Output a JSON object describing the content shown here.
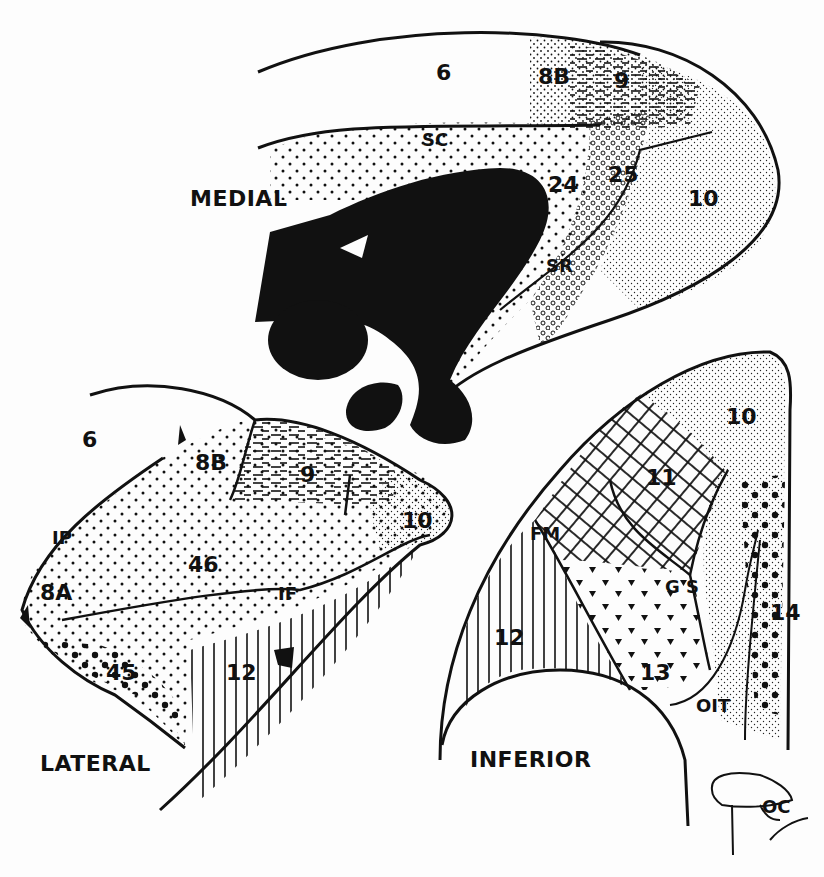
{
  "figure": {
    "type": "cytoarchitectonic map",
    "colors": {
      "ink": "#111111",
      "paper": "#fdfdfd"
    }
  },
  "views": {
    "medial": {
      "label": "MEDIAL",
      "areas": [
        {
          "id": "6",
          "label": "6",
          "pattern": "blank"
        },
        {
          "id": "8B",
          "label": "8B",
          "pattern": "fine-dots"
        },
        {
          "id": "9",
          "label": "9",
          "pattern": "dashes"
        },
        {
          "id": "24",
          "label": "24",
          "pattern": "medium-dots"
        },
        {
          "id": "25",
          "label": "25",
          "pattern": "open-circles"
        },
        {
          "id": "10",
          "label": "10",
          "pattern": "fine-stipple"
        }
      ],
      "sulci": [
        {
          "id": "SC",
          "label": "SC"
        },
        {
          "id": "SR",
          "label": "SR"
        }
      ],
      "structures": [
        {
          "id": "corpus-callosum",
          "fill": "solid-black"
        }
      ]
    },
    "lateral": {
      "label": "LATERAL",
      "areas": [
        {
          "id": "6",
          "label": "6",
          "pattern": "blank"
        },
        {
          "id": "8B",
          "label": "8B",
          "pattern": "fine-dots"
        },
        {
          "id": "9",
          "label": "9",
          "pattern": "dashes"
        },
        {
          "id": "10",
          "label": "10",
          "pattern": "fine-stipple"
        },
        {
          "id": "8A",
          "label": "8A",
          "pattern": "fine-dots"
        },
        {
          "id": "46",
          "label": "46",
          "pattern": "medium-dots"
        },
        {
          "id": "45",
          "label": "45",
          "pattern": "large-dots"
        },
        {
          "id": "12",
          "label": "12",
          "pattern": "vertical-lines"
        }
      ],
      "sulci": [
        {
          "id": "IP",
          "label": "IP"
        },
        {
          "id": "IF",
          "label": "IF"
        }
      ]
    },
    "inferior": {
      "label": "INFERIOR",
      "areas": [
        {
          "id": "10",
          "label": "10",
          "pattern": "fine-stipple"
        },
        {
          "id": "11",
          "label": "11",
          "pattern": "crosshatch"
        },
        {
          "id": "12",
          "label": "12",
          "pattern": "vertical-lines"
        },
        {
          "id": "13",
          "label": "13",
          "pattern": "triangles"
        },
        {
          "id": "14",
          "label": "14",
          "pattern": "large-dots"
        }
      ],
      "sulci": [
        {
          "id": "FM",
          "label": "FM"
        },
        {
          "id": "GS",
          "label": "G S"
        },
        {
          "id": "OIT",
          "label": "OIT"
        }
      ],
      "structures": [
        {
          "id": "OC",
          "label": "OC"
        }
      ]
    }
  }
}
